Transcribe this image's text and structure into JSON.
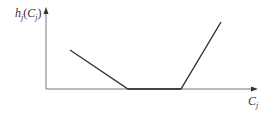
{
  "diagram": {
    "type": "piecewise-linear function plot",
    "y_axis_label": {
      "base": "h",
      "sub": "j",
      "open": "(",
      "arg": "C",
      "arg_sub": "j",
      "close": ")"
    },
    "x_axis_label": {
      "base": "C",
      "sub": "j"
    },
    "segments": [
      {
        "name": "decreasing",
        "from": [
          70,
          50
        ],
        "to": [
          128,
          89
        ]
      },
      {
        "name": "flat",
        "from": [
          128,
          89
        ],
        "to": [
          181,
          89
        ]
      },
      {
        "name": "increasing",
        "from": [
          181,
          89
        ],
        "to": [
          221,
          22
        ]
      }
    ],
    "colors": {
      "axis": "#777777",
      "curve": "#333333"
    }
  }
}
